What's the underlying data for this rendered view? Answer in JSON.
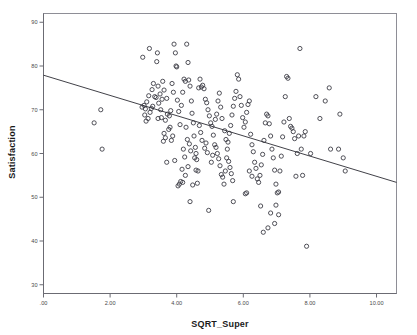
{
  "chart_data": {
    "type": "scatter",
    "title": "",
    "xlabel": "SQRT_Super",
    "ylabel": "Satisfaction",
    "xlim": [
      0.0,
      10.6
    ],
    "ylim": [
      28.0,
      92.0
    ],
    "grid": false,
    "legend": null,
    "x_ticks": [
      ".00",
      "2.00",
      "4.00",
      "6.00",
      "8.00",
      "10.00"
    ],
    "x_tick_values": [
      0,
      2,
      4,
      6,
      8,
      10
    ],
    "y_ticks": [
      "90",
      "80",
      "70",
      "60",
      "50",
      "40",
      "30"
    ],
    "y_tick_values": [
      90,
      80,
      70,
      60,
      50,
      40,
      30
    ],
    "marker": {
      "shape": "open-circle",
      "radius": 2.1,
      "stroke": "#3d3d46",
      "stroke_width": 0.9,
      "fill": "none"
    },
    "fit_line": {
      "type": "linear",
      "stroke": "#2b2b33",
      "stroke_width": 0.9,
      "x_start": 0.0,
      "y_start": 77.9,
      "x_end": 10.6,
      "y_end": 53.4
    },
    "points": [
      [
        1.52,
        67.0
      ],
      [
        1.72,
        70.0
      ],
      [
        1.76,
        61.0
      ],
      [
        2.98,
        82.0
      ],
      [
        3.18,
        84.0
      ],
      [
        3.42,
        83.0
      ],
      [
        3.4,
        81.0
      ],
      [
        3.3,
        76.0
      ],
      [
        3.34,
        73.0
      ],
      [
        3.46,
        71.5
      ],
      [
        3.24,
        70.3
      ],
      [
        3.52,
        70.0
      ],
      [
        3.58,
        76.5
      ],
      [
        3.62,
        74.5
      ],
      [
        3.7,
        72.6
      ],
      [
        3.72,
        69.0
      ],
      [
        3.44,
        68.0
      ],
      [
        3.54,
        68.2
      ],
      [
        3.66,
        67.6
      ],
      [
        3.86,
        76.0
      ],
      [
        3.9,
        74.0
      ],
      [
        3.96,
        83.0
      ],
      [
        3.98,
        80.0
      ],
      [
        3.92,
        85.0
      ],
      [
        4.0,
        79.8
      ],
      [
        4.02,
        72.2
      ],
      [
        4.06,
        69.6
      ],
      [
        4.1,
        66.6
      ],
      [
        3.88,
        64.0
      ],
      [
        3.84,
        63.0
      ],
      [
        3.8,
        66.0
      ],
      [
        3.76,
        65.5
      ],
      [
        3.78,
        68.6
      ],
      [
        3.82,
        69.8
      ],
      [
        4.14,
        71.0
      ],
      [
        4.18,
        74.0
      ],
      [
        4.22,
        77.0
      ],
      [
        4.26,
        76.5
      ],
      [
        4.3,
        85.0
      ],
      [
        4.34,
        80.8
      ],
      [
        4.36,
        76.8
      ],
      [
        4.4,
        75.4
      ],
      [
        4.44,
        72.0
      ],
      [
        4.46,
        69.2
      ],
      [
        4.5,
        67.0
      ],
      [
        4.52,
        64.0
      ],
      [
        4.56,
        61.4
      ],
      [
        4.58,
        60.0
      ],
      [
        4.6,
        58.6
      ],
      [
        4.64,
        56.0
      ],
      [
        4.2,
        61.0
      ],
      [
        4.24,
        59.2
      ],
      [
        4.16,
        56.4
      ],
      [
        4.12,
        53.6
      ],
      [
        4.08,
        53.0
      ],
      [
        4.04,
        52.6
      ],
      [
        3.94,
        58.4
      ],
      [
        3.7,
        58.0
      ],
      [
        3.66,
        63.6
      ],
      [
        3.6,
        62.8
      ],
      [
        3.62,
        64.6
      ],
      [
        3.56,
        72.4
      ],
      [
        3.5,
        73.6
      ],
      [
        3.38,
        72.8
      ],
      [
        3.28,
        70.8
      ],
      [
        3.2,
        69.4
      ],
      [
        3.14,
        68.0
      ],
      [
        3.08,
        67.4
      ],
      [
        3.06,
        70.2
      ],
      [
        3.02,
        71.0
      ],
      [
        4.66,
        75.0
      ],
      [
        4.7,
        77.0
      ],
      [
        4.74,
        75.2
      ],
      [
        4.78,
        75.6
      ],
      [
        4.82,
        74.8
      ],
      [
        4.86,
        72.4
      ],
      [
        4.9,
        71.6
      ],
      [
        4.94,
        70.0
      ],
      [
        4.98,
        68.6
      ],
      [
        5.02,
        67.0
      ],
      [
        5.06,
        66.2
      ],
      [
        5.1,
        64.2
      ],
      [
        5.14,
        62.0
      ],
      [
        5.18,
        61.4
      ],
      [
        5.22,
        60.0
      ],
      [
        5.26,
        58.8
      ],
      [
        5.3,
        57.2
      ],
      [
        5.34,
        55.2
      ],
      [
        5.38,
        54.6
      ],
      [
        5.42,
        53.0
      ],
      [
        5.46,
        56.0
      ],
      [
        5.5,
        59.0
      ],
      [
        5.54,
        62.6
      ],
      [
        5.58,
        64.6
      ],
      [
        5.62,
        66.4
      ],
      [
        5.66,
        68.8
      ],
      [
        5.7,
        70.8
      ],
      [
        5.74,
        72.6
      ],
      [
        5.78,
        74.2
      ],
      [
        5.82,
        78.0
      ],
      [
        5.86,
        77.0
      ],
      [
        5.9,
        73.0
      ],
      [
        5.94,
        71.0
      ],
      [
        5.98,
        68.2
      ],
      [
        6.02,
        66.0
      ],
      [
        6.06,
        67.2
      ],
      [
        6.1,
        69.4
      ],
      [
        6.14,
        71.2
      ],
      [
        6.18,
        72.0
      ],
      [
        6.22,
        64.4
      ],
      [
        6.26,
        62.0
      ],
      [
        6.3,
        60.4
      ],
      [
        6.34,
        58.0
      ],
      [
        6.38,
        56.6
      ],
      [
        6.42,
        54.2
      ],
      [
        6.46,
        53.4
      ],
      [
        6.5,
        55.0
      ],
      [
        6.54,
        57.4
      ],
      [
        6.58,
        59.8
      ],
      [
        6.62,
        63.0
      ],
      [
        6.66,
        67.0
      ],
      [
        6.7,
        69.0
      ],
      [
        6.74,
        68.6
      ],
      [
        6.78,
        66.8
      ],
      [
        6.82,
        64.0
      ],
      [
        6.86,
        61.0
      ],
      [
        6.9,
        59.0
      ],
      [
        6.94,
        56.2
      ],
      [
        6.98,
        53.0
      ],
      [
        7.02,
        51.0
      ],
      [
        7.06,
        51.2
      ],
      [
        7.1,
        56.0
      ],
      [
        7.14,
        59.4
      ],
      [
        7.18,
        63.8
      ],
      [
        7.22,
        67.2
      ],
      [
        7.26,
        73.0
      ],
      [
        7.3,
        77.6
      ],
      [
        7.34,
        77.2
      ],
      [
        7.38,
        68.0
      ],
      [
        7.42,
        66.2
      ],
      [
        7.46,
        65.8
      ],
      [
        7.5,
        65.0
      ],
      [
        7.54,
        63.4
      ],
      [
        7.58,
        54.8
      ],
      [
        7.62,
        60.0
      ],
      [
        7.66,
        64.0
      ],
      [
        7.7,
        84.0
      ],
      [
        7.74,
        61.0
      ],
      [
        7.78,
        55.0
      ],
      [
        8.18,
        73.0
      ],
      [
        8.3,
        68.0
      ],
      [
        8.46,
        72.0
      ],
      [
        8.58,
        75.0
      ],
      [
        8.62,
        61.0
      ],
      [
        8.86,
        61.0
      ],
      [
        8.9,
        69.0
      ],
      [
        9.0,
        59.0
      ],
      [
        9.06,
        56.0
      ],
      [
        7.9,
        38.8
      ],
      [
        5.7,
        49.0
      ],
      [
        4.96,
        47.0
      ],
      [
        4.4,
        49.0
      ],
      [
        6.6,
        42.0
      ],
      [
        6.74,
        43.0
      ],
      [
        6.94,
        44.0
      ],
      [
        7.06,
        46.0
      ],
      [
        6.82,
        46.4
      ],
      [
        6.52,
        48.0
      ],
      [
        6.98,
        48.2
      ],
      [
        4.58,
        56.2
      ],
      [
        4.62,
        53.2
      ],
      [
        4.48,
        52.8
      ],
      [
        5.04,
        58.0
      ],
      [
        5.08,
        59.6
      ],
      [
        4.92,
        60.2
      ],
      [
        4.88,
        62.4
      ],
      [
        4.84,
        61.2
      ],
      [
        4.76,
        63.0
      ],
      [
        4.72,
        64.8
      ],
      [
        4.68,
        66.4
      ],
      [
        5.16,
        67.8
      ],
      [
        5.2,
        69.0
      ],
      [
        5.24,
        72.0
      ],
      [
        5.28,
        73.8
      ],
      [
        5.32,
        70.6
      ],
      [
        5.36,
        68.0
      ],
      [
        5.44,
        65.2
      ],
      [
        5.48,
        63.2
      ],
      [
        5.52,
        61.0
      ],
      [
        5.56,
        58.2
      ],
      [
        5.6,
        56.8
      ],
      [
        5.64,
        55.4
      ],
      [
        5.68,
        53.8
      ],
      [
        3.44,
        75.4
      ],
      [
        3.26,
        74.6
      ],
      [
        3.16,
        73.2
      ],
      [
        3.1,
        71.8
      ],
      [
        3.04,
        68.8
      ],
      [
        2.96,
        70.6
      ],
      [
        4.28,
        66.0
      ],
      [
        4.32,
        63.2
      ],
      [
        4.38,
        62.2
      ],
      [
        4.42,
        60.6
      ],
      [
        4.54,
        59.0
      ],
      [
        4.34,
        57.0
      ],
      [
        4.26,
        55.0
      ],
      [
        4.18,
        53.4
      ],
      [
        6.06,
        50.8
      ],
      [
        6.1,
        51.0
      ],
      [
        7.82,
        64.0
      ],
      [
        7.86,
        65.0
      ],
      [
        8.02,
        60.0
      ],
      [
        6.18,
        56.0
      ],
      [
        6.26,
        54.8
      ]
    ]
  },
  "axes": {
    "x_axis_name": "x-axis",
    "y_axis_name": "y-axis"
  }
}
